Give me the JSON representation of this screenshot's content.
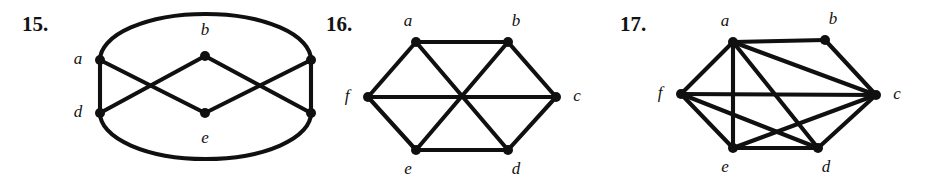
{
  "page": {
    "background_color": "#ffffff",
    "ink_color": "#101010",
    "width": 929,
    "height": 184
  },
  "figures": [
    {
      "number_label": "15.",
      "name": "graph-15",
      "vertices": [
        {
          "id": "a",
          "label": "a",
          "x": 100,
          "y": 60,
          "label_x": 78,
          "label_y": 60
        },
        {
          "id": "b",
          "label": "b",
          "x": 205,
          "y": 56,
          "label_x": 205,
          "label_y": 31
        },
        {
          "id": "c",
          "label": "c",
          "x": 311,
          "y": 60,
          "label_x": 333,
          "label_y": 60
        },
        {
          "id": "d",
          "label": "d",
          "x": 100,
          "y": 113,
          "label_x": 78,
          "label_y": 113
        },
        {
          "id": "e",
          "label": "e",
          "x": 205,
          "y": 113,
          "label_x": 205,
          "label_y": 139
        },
        {
          "id": "f",
          "label": "f",
          "x": 311,
          "y": 113,
          "label_x": 333,
          "label_y": 113
        }
      ],
      "edges": [
        {
          "from": "a",
          "to": "d",
          "type": "line"
        },
        {
          "from": "c",
          "to": "f",
          "type": "line"
        },
        {
          "from": "a",
          "to": "e",
          "type": "line"
        },
        {
          "from": "d",
          "to": "b",
          "type": "line"
        },
        {
          "from": "b",
          "to": "f",
          "type": "line"
        },
        {
          "from": "e",
          "to": "c",
          "type": "line"
        },
        {
          "from": "a",
          "to": "c",
          "type": "arc-top"
        },
        {
          "from": "d",
          "to": "f",
          "type": "arc-bottom"
        }
      ]
    },
    {
      "number_label": "16.",
      "name": "graph-16",
      "vertices": [
        {
          "id": "a",
          "label": "a",
          "x": 100,
          "y": 42,
          "label_x": 92,
          "label_y": 22
        },
        {
          "id": "b",
          "label": "b",
          "x": 192,
          "y": 42,
          "label_x": 200,
          "label_y": 22
        },
        {
          "id": "c",
          "label": "c",
          "x": 240,
          "y": 97,
          "label_x": 261,
          "label_y": 97
        },
        {
          "id": "d",
          "label": "d",
          "x": 192,
          "y": 150,
          "label_x": 200,
          "label_y": 170
        },
        {
          "id": "e",
          "label": "e",
          "x": 100,
          "y": 150,
          "label_x": 92,
          "label_y": 170
        },
        {
          "id": "f",
          "label": "f",
          "x": 52,
          "y": 97,
          "label_x": 31,
          "label_y": 97
        }
      ],
      "edges": [
        {
          "from": "a",
          "to": "b",
          "type": "line"
        },
        {
          "from": "b",
          "to": "c",
          "type": "line"
        },
        {
          "from": "c",
          "to": "d",
          "type": "line"
        },
        {
          "from": "d",
          "to": "e",
          "type": "line"
        },
        {
          "from": "e",
          "to": "f",
          "type": "line"
        },
        {
          "from": "f",
          "to": "a",
          "type": "line"
        },
        {
          "from": "a",
          "to": "d",
          "type": "line"
        },
        {
          "from": "b",
          "to": "e",
          "type": "line"
        },
        {
          "from": "c",
          "to": "f",
          "type": "line"
        }
      ]
    },
    {
      "number_label": "17.",
      "name": "graph-17",
      "vertices": [
        {
          "id": "a",
          "label": "a",
          "x": 125,
          "y": 42,
          "label_x": 117,
          "label_y": 22
        },
        {
          "id": "b",
          "label": "b",
          "x": 217,
          "y": 40,
          "label_x": 225,
          "label_y": 20
        },
        {
          "id": "c",
          "label": "c",
          "x": 268,
          "y": 95,
          "label_x": 289,
          "label_y": 95
        },
        {
          "id": "d",
          "label": "d",
          "x": 210,
          "y": 148,
          "label_x": 218,
          "label_y": 168
        },
        {
          "id": "e",
          "label": "e",
          "x": 125,
          "y": 148,
          "label_x": 117,
          "label_y": 168
        },
        {
          "id": "f",
          "label": "f",
          "x": 73,
          "y": 94,
          "label_x": 52,
          "label_y": 94
        }
      ],
      "edges": [
        {
          "from": "a",
          "to": "b",
          "type": "line"
        },
        {
          "from": "b",
          "to": "c",
          "type": "line"
        },
        {
          "from": "a",
          "to": "c",
          "type": "line"
        },
        {
          "from": "a",
          "to": "f",
          "type": "line"
        },
        {
          "from": "a",
          "to": "e",
          "type": "line"
        },
        {
          "from": "a",
          "to": "d",
          "type": "line"
        },
        {
          "from": "f",
          "to": "c",
          "type": "line"
        },
        {
          "from": "f",
          "to": "e",
          "type": "line"
        },
        {
          "from": "f",
          "to": "d",
          "type": "line"
        },
        {
          "from": "e",
          "to": "c",
          "type": "line"
        },
        {
          "from": "e",
          "to": "d",
          "type": "line"
        },
        {
          "from": "d",
          "to": "c",
          "type": "line"
        }
      ]
    }
  ]
}
